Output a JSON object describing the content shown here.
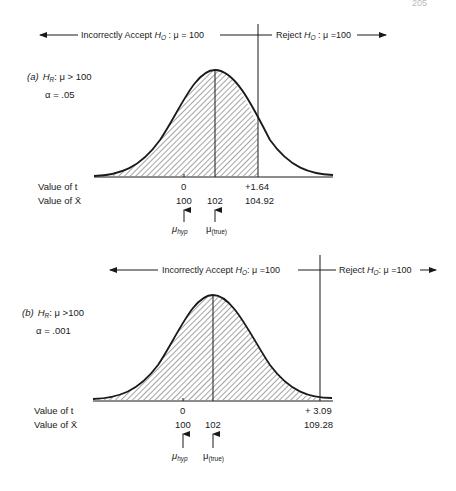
{
  "page_number": "205",
  "panels": [
    {
      "id": "a",
      "label": "(a)",
      "hypothesis_prefix": "H",
      "hypothesis_sub": "R",
      "hypothesis_rest": ": μ > 100",
      "alpha_label": "α = .05",
      "top_left_text_prefix": "Incorrectly Accept ",
      "top_left_H": "H",
      "top_left_sub": "O",
      "top_left_rest": " : μ = 100",
      "top_right_text_prefix": "Reject ",
      "top_right_H": "H",
      "top_right_sub": "O",
      "top_right_rest": " : μ =100",
      "row1_label": "Value of t",
      "row2_label": "Value of X̄",
      "t_zero": "0",
      "t_crit": "+1.64",
      "x_hyp": "100",
      "x_true": "102",
      "x_crit": "104.92",
      "mu_hyp_label": "μ",
      "mu_hyp_sub": "hyp",
      "mu_true_label": "μ",
      "mu_true_sub": "(true)"
    },
    {
      "id": "b",
      "label": "(b)",
      "hypothesis_prefix": "H",
      "hypothesis_sub": "R",
      "hypothesis_rest": ": μ >100",
      "alpha_label": "α = .001",
      "top_left_text_prefix": "Incorrectly Accept ",
      "top_left_H": "H",
      "top_left_sub": "O",
      "top_left_rest": ": μ =100",
      "top_right_text_prefix": "Reject ",
      "top_right_H": "H",
      "top_right_sub": "O",
      "top_right_rest": ": μ =100",
      "row1_label": "Value of t",
      "row2_label": "Value of X̄",
      "t_zero": "0",
      "t_crit": "+ 3.09",
      "x_hyp": "100",
      "x_true": "102",
      "x_crit": "109.28",
      "mu_hyp_label": "μ",
      "mu_hyp_sub": "hyp",
      "mu_true_label": "μ",
      "mu_true_sub": "(true)"
    }
  ],
  "colors": {
    "ink": "#1a1a1a",
    "background": "#ffffff"
  }
}
